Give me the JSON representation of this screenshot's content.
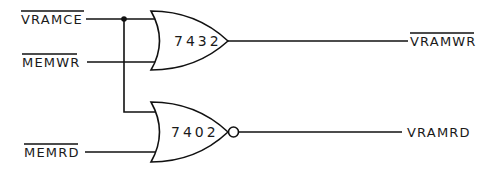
{
  "diagram": {
    "type": "logic-schematic",
    "inputs": [
      {
        "id": "vramce",
        "label": "VRAMCE",
        "active_low": true
      },
      {
        "id": "memwr",
        "label": "MEMWR",
        "active_low": true
      },
      {
        "id": "memrd",
        "label": "MEMRD",
        "active_low": true
      }
    ],
    "gates": [
      {
        "id": "g1",
        "type": "OR",
        "part": "7432",
        "inputs": [
          "vramce",
          "memwr"
        ],
        "output": "vramwr"
      },
      {
        "id": "g2",
        "type": "NOR",
        "part": "7402",
        "inputs": [
          "vramce",
          "memrd"
        ],
        "output": "vramrd"
      }
    ],
    "outputs": [
      {
        "id": "vramwr",
        "label": "VRAMWR",
        "active_low": true
      },
      {
        "id": "vramrd",
        "label": "VRAMRD",
        "active_low": false
      }
    ],
    "junctions": [
      {
        "net": "vramce",
        "x": 124,
        "y": 19
      }
    ],
    "colors": {
      "line": "#111111",
      "background": "#ffffff"
    }
  }
}
